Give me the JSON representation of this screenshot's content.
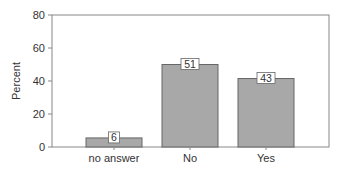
{
  "chart_data": {
    "type": "bar",
    "title": "",
    "xlabel": "",
    "ylabel": "Percent",
    "categories": [
      "no answer",
      "No",
      "Yes"
    ],
    "values": [
      6,
      51,
      43
    ],
    "bar_heights_drawn": [
      5.5,
      50,
      41.5
    ],
    "data_labels": [
      "6",
      "51",
      "43"
    ],
    "ylim": [
      0,
      80
    ],
    "yticks": [
      "0",
      "20",
      "40",
      "60",
      "80"
    ],
    "grid": false,
    "legend": null,
    "bar_color": "#a8a8a8",
    "bar_edge_color": "#666666"
  }
}
